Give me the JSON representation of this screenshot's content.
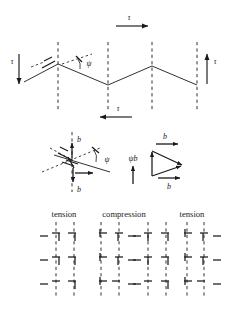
{
  "figure": {
    "colors": {
      "ink": "#1a1a1a",
      "background": "#ffffff"
    },
    "panels": {
      "top": {
        "name": "zigzag-shear-panel",
        "shear_labels": [
          {
            "id": "tau-left",
            "text": "τ",
            "arrow": "down",
            "x": 12,
            "y": 62
          },
          {
            "id": "tau-top",
            "text": "τ",
            "arrow": "right",
            "x": 130,
            "y": 16
          },
          {
            "id": "tau-right",
            "text": "τ",
            "arrow": "up",
            "x": 214,
            "y": 62
          },
          {
            "id": "tau-bottom",
            "text": "τ",
            "arrow": "left",
            "x": 120,
            "y": 110
          }
        ],
        "angle_label": {
          "id": "psi-angle",
          "text": "ψ"
        },
        "dislocation_marker": {
          "id": "dislocation-symbol",
          "text": "⊥"
        },
        "dashed_columns": [
          58,
          108,
          152,
          197
        ],
        "zigzag_points": "24,82 58,64 108,85 152,66 197,85"
      },
      "middle": {
        "name": "burgers-vector-panel",
        "left_diagram": {
          "name": "burgers-vector-decomposition",
          "labels": [
            {
              "id": "b-upper",
              "text": "b"
            },
            {
              "id": "b-lower",
              "text": "b"
            },
            {
              "id": "psi",
              "text": "ψ"
            }
          ]
        },
        "right_diagram": {
          "name": "vector-triangle",
          "labels": [
            {
              "id": "b-top",
              "text": "b"
            },
            {
              "id": "b-bottom",
              "text": "b"
            },
            {
              "id": "psi-b",
              "text": "ψb"
            }
          ]
        }
      },
      "bottom": {
        "name": "tension-compression-lattice-panel",
        "column_labels": [
          {
            "id": "label-tension-left",
            "text": "tension",
            "x": 64
          },
          {
            "id": "label-compression",
            "text": "compression",
            "x": 124
          },
          {
            "id": "label-tension-right",
            "text": "tension",
            "x": 192
          }
        ],
        "lattice_columns": [
          {
            "id": "lattice-column-1",
            "region": "tension",
            "x": 64,
            "dash_x": [
              56,
              74
            ],
            "rows": [
              {
                "y": 236,
                "symbols": [
                  "dash-left",
                  "tee-right-1",
                  "tee-right-2"
                ]
              },
              {
                "y": 260,
                "symbols": [
                  "dash-left",
                  "tee-right-1",
                  "tee-right-2"
                ]
              },
              {
                "y": 284,
                "symbols": [
                  "dash-left",
                  "tee-right-1",
                  "tee-right-2"
                ]
              }
            ]
          },
          {
            "id": "lattice-column-2",
            "region": "compression",
            "x": 110,
            "dash_x": [
              101,
              119
            ],
            "rows": [
              {
                "y": 236,
                "symbols": [
                  "tee-left-1",
                  "tee-left-2",
                  "dash-right"
                ]
              },
              {
                "y": 260,
                "symbols": [
                  "tee-left-1",
                  "tee-left-2",
                  "dash-right"
                ]
              },
              {
                "y": 284,
                "symbols": [
                  "tee-left-1",
                  "tee-left-2",
                  "dash-right"
                ]
              }
            ]
          },
          {
            "id": "lattice-column-3",
            "region": "compression",
            "x": 157,
            "dash_x": [
              148,
              166
            ],
            "rows": [
              {
                "y": 236,
                "symbols": [
                  "dash-left",
                  "tee-mid",
                  "tee-right"
                ]
              },
              {
                "y": 260,
                "symbols": [
                  "dash-left",
                  "tee-mid",
                  "tee-right"
                ]
              },
              {
                "y": 284,
                "symbols": [
                  "dash-left",
                  "tee-mid",
                  "tee-right"
                ]
              }
            ]
          },
          {
            "id": "lattice-column-4",
            "region": "tension",
            "x": 195,
            "dash_x": [
              187,
              204
            ],
            "rows": [
              {
                "y": 236,
                "symbols": [
                  "tee-left",
                  "tee-mid",
                  "dash-right"
                ]
              },
              {
                "y": 260,
                "symbols": [
                  "tee-left",
                  "tee-mid",
                  "dash-right"
                ]
              },
              {
                "y": 284,
                "symbols": [
                  "tee-left",
                  "tee-mid",
                  "dash-right"
                ]
              }
            ]
          }
        ]
      }
    }
  }
}
